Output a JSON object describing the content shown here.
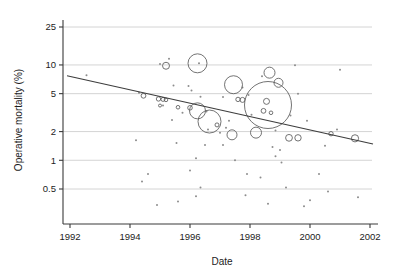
{
  "chart_data": {
    "type": "scatter",
    "title": "",
    "xlabel": "Date",
    "ylabel": "Operative mortality (%)",
    "yscale": "log",
    "xlim": [
      1991.3,
      2002.4
    ],
    "ylim": [
      0.3,
      30
    ],
    "grid": true,
    "legend": null,
    "x_ticks": [
      1992,
      1994,
      1996,
      1998,
      2000,
      2002
    ],
    "x_tick_labels": [
      "1992",
      "1994",
      "1996",
      "1998",
      "2000",
      "2002"
    ],
    "y_ticks": [
      0.5,
      1,
      2,
      5,
      10,
      25
    ],
    "y_tick_labels": [
      "0.5",
      "1",
      "2",
      "5",
      "10",
      "25"
    ],
    "series": [
      {
        "name": "studies",
        "marker": "open-circle",
        "size_encodes": "study weight",
        "points": [
          {
            "x": 1996.25,
            "y": 10.4,
            "r": 9.5
          },
          {
            "x": 1997.45,
            "y": 6.2,
            "r": 9.0
          },
          {
            "x": 1998.6,
            "y": 3.8,
            "r": 23.5
          },
          {
            "x": 1996.65,
            "y": 2.55,
            "r": 11.5
          },
          {
            "x": 1996.25,
            "y": 3.3,
            "r": 8.0
          },
          {
            "x": 1998.65,
            "y": 8.3,
            "r": 5.5
          },
          {
            "x": 1998.95,
            "y": 6.5,
            "r": 4.5
          },
          {
            "x": 1998.2,
            "y": 1.95,
            "r": 5.5
          },
          {
            "x": 1997.4,
            "y": 1.85,
            "r": 5.0
          },
          {
            "x": 1995.2,
            "y": 9.8,
            "r": 3.5
          },
          {
            "x": 1998.55,
            "y": 4.15,
            "r": 3.0
          },
          {
            "x": 1997.75,
            "y": 4.3,
            "r": 2.5
          },
          {
            "x": 1997.6,
            "y": 4.35,
            "r": 2.2
          },
          {
            "x": 1998.45,
            "y": 3.3,
            "r": 2.4
          },
          {
            "x": 1998.7,
            "y": 3.15,
            "r": 1.8
          },
          {
            "x": 1999.3,
            "y": 1.72,
            "r": 3.4
          },
          {
            "x": 1999.6,
            "y": 1.72,
            "r": 3.2
          },
          {
            "x": 2001.5,
            "y": 1.7,
            "r": 3.6
          },
          {
            "x": 2000.7,
            "y": 1.9,
            "r": 2.2
          },
          {
            "x": 1994.45,
            "y": 4.75,
            "r": 2.4
          },
          {
            "x": 1994.95,
            "y": 4.4,
            "r": 2.2
          },
          {
            "x": 1995.1,
            "y": 4.35,
            "r": 2.0
          },
          {
            "x": 1995.2,
            "y": 4.3,
            "r": 1.8
          },
          {
            "x": 1996.0,
            "y": 3.55,
            "r": 2.3
          },
          {
            "x": 1995.6,
            "y": 3.6,
            "r": 1.8
          },
          {
            "x": 1996.9,
            "y": 2.35,
            "r": 2.0
          },
          {
            "x": 1995.0,
            "y": 3.75,
            "r": 1.5
          }
        ]
      },
      {
        "name": "small-studies",
        "marker": "dot",
        "points": [
          {
            "x": 1992.55,
            "y": 7.8
          },
          {
            "x": 1995.3,
            "y": 11.6
          },
          {
            "x": 1995.0,
            "y": 10.2
          },
          {
            "x": 1996.3,
            "y": 10.4
          },
          {
            "x": 1999.5,
            "y": 9.9
          },
          {
            "x": 2001.0,
            "y": 8.9
          },
          {
            "x": 1995.45,
            "y": 6.1
          },
          {
            "x": 1995.95,
            "y": 6.0
          },
          {
            "x": 1996.05,
            "y": 5.4
          },
          {
            "x": 1997.75,
            "y": 5.8
          },
          {
            "x": 1998.4,
            "y": 7.6
          },
          {
            "x": 1994.3,
            "y": 5.1
          },
          {
            "x": 1996.35,
            "y": 4.65
          },
          {
            "x": 1997.1,
            "y": 4.6
          },
          {
            "x": 1997.95,
            "y": 4.85
          },
          {
            "x": 1999.6,
            "y": 5.0
          },
          {
            "x": 1995.1,
            "y": 3.75
          },
          {
            "x": 1995.75,
            "y": 3.15
          },
          {
            "x": 1996.55,
            "y": 3.25
          },
          {
            "x": 1997.3,
            "y": 2.6
          },
          {
            "x": 1998.05,
            "y": 3.0
          },
          {
            "x": 1999.35,
            "y": 2.95
          },
          {
            "x": 1999.9,
            "y": 2.6
          },
          {
            "x": 1995.4,
            "y": 2.65
          },
          {
            "x": 1996.6,
            "y": 2.1
          },
          {
            "x": 1997.2,
            "y": 2.2
          },
          {
            "x": 1997.0,
            "y": 1.95
          },
          {
            "x": 1998.85,
            "y": 2.05
          },
          {
            "x": 2000.9,
            "y": 2.1
          },
          {
            "x": 1994.2,
            "y": 1.62
          },
          {
            "x": 1995.55,
            "y": 1.52
          },
          {
            "x": 1996.5,
            "y": 1.45
          },
          {
            "x": 1997.1,
            "y": 1.45
          },
          {
            "x": 1998.75,
            "y": 1.38
          },
          {
            "x": 1999.0,
            "y": 1.28
          },
          {
            "x": 2000.5,
            "y": 1.42
          },
          {
            "x": 1998.85,
            "y": 1.1
          },
          {
            "x": 1999.05,
            "y": 0.95
          },
          {
            "x": 1996.2,
            "y": 1.05
          },
          {
            "x": 1997.5,
            "y": 1.0
          },
          {
            "x": 1994.6,
            "y": 0.72
          },
          {
            "x": 1996.0,
            "y": 0.78
          },
          {
            "x": 1997.9,
            "y": 0.72
          },
          {
            "x": 1998.35,
            "y": 0.66
          },
          {
            "x": 2000.3,
            "y": 0.72
          },
          {
            "x": 1994.4,
            "y": 0.6
          },
          {
            "x": 1996.35,
            "y": 0.52
          },
          {
            "x": 1999.2,
            "y": 0.52
          },
          {
            "x": 2000.6,
            "y": 0.47
          },
          {
            "x": 1996.2,
            "y": 0.42
          },
          {
            "x": 1997.85,
            "y": 0.43
          },
          {
            "x": 2001.6,
            "y": 0.41
          },
          {
            "x": 1995.6,
            "y": 0.37
          },
          {
            "x": 1998.6,
            "y": 0.35
          },
          {
            "x": 2000.0,
            "y": 0.38
          },
          {
            "x": 1994.9,
            "y": 0.34
          },
          {
            "x": 1999.8,
            "y": 0.33
          }
        ]
      }
    ],
    "trend_line": {
      "name": "meta-regression",
      "x_start": 1991.9,
      "y_start": 7.7,
      "x_end": 2002.1,
      "y_end": 1.48
    }
  }
}
